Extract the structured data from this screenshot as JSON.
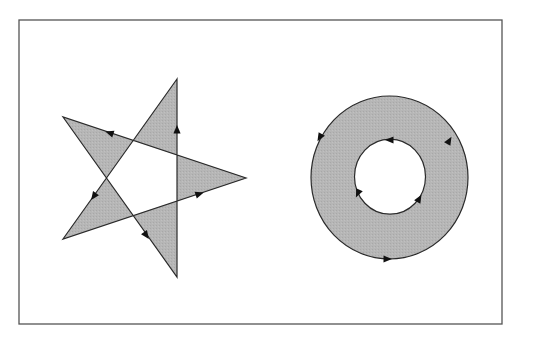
{
  "figure": {
    "frame": {
      "x": 19,
      "y": 20,
      "width": 483,
      "height": 304,
      "stroke": "#555555",
      "stroke_width": 1.3
    },
    "colors": {
      "fill": "#b4b4b4",
      "stroke": "#2a2a2a",
      "background": "#ffffff",
      "arrow": "#111111"
    },
    "star": {
      "label": "pentagram (self-intersecting polygon, even-odd fill)",
      "fill_rule": "evenodd",
      "vertices": [
        {
          "name": "top",
          "x": 177,
          "y": 79
        },
        {
          "name": "bottom-left",
          "x": 63,
          "y": 239
        },
        {
          "name": "right",
          "x": 246,
          "y": 178
        },
        {
          "name": "top-left",
          "x": 63,
          "y": 117
        },
        {
          "name": "bottom",
          "x": 177,
          "y": 277
        }
      ],
      "arrows": [
        {
          "x": 94,
          "y": 196,
          "angle": 125
        },
        {
          "x": 199,
          "y": 194,
          "angle": -18
        },
        {
          "x": 110,
          "y": 133,
          "angle": 198
        },
        {
          "x": 146,
          "y": 235,
          "angle": 55
        },
        {
          "x": 177,
          "y": 130,
          "angle": -90
        }
      ]
    },
    "ring": {
      "label": "annulus (two concentric contours, even-odd fill)",
      "fill_rule": "evenodd",
      "outer": {
        "cx": 389.5,
        "cy": 177.5,
        "rx": 78.5,
        "ry": 81.5
      },
      "inner": {
        "cx": 390,
        "cy": 176.7,
        "rx": 35.5,
        "ry": 37.5
      },
      "outer_arrows": [
        {
          "x": 320,
          "y": 137,
          "angle": 120
        },
        {
          "x": 449,
          "y": 141,
          "angle": -60
        },
        {
          "x": 387,
          "y": 259,
          "angle": 0
        }
      ],
      "inner_arrows": [
        {
          "x": 390,
          "y": 140,
          "angle": 180
        },
        {
          "x": 358,
          "y": 193,
          "angle": 115
        },
        {
          "x": 419,
          "y": 199,
          "angle": -60
        }
      ]
    }
  }
}
